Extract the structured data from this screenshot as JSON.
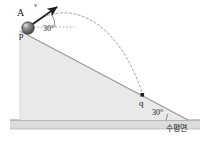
{
  "figure": {
    "type": "physics-projectile-on-incline-diagram",
    "colors": {
      "incline_fill": "#e9e9e9",
      "incline_stroke": "#9a9a9a",
      "ground_fill": "#dcdcdc",
      "ground_stroke": "#8f8f8f",
      "trajectory_stroke": "#9a9a9a",
      "arrow_stroke": "#1f1f1f",
      "ball_dark": "#4a4a4a",
      "ball_light": "#b8b8b8",
      "text": "#1a1a1a",
      "background": "#ffffff"
    },
    "labels": {
      "object_label": "A",
      "velocity_label": "v",
      "launch_point": "p",
      "landing_point": "q",
      "launch_angle": "30°",
      "incline_angle": "30°",
      "ground_label": "수평면"
    },
    "geometry": {
      "launch_point_xy": [
        28,
        28
      ],
      "landing_point_xy": [
        143,
        96
      ],
      "arrow_tip_xy": [
        59,
        5
      ],
      "incline_top_xy": [
        20,
        31
      ],
      "incline_base_xy": [
        188,
        120
      ],
      "ground_y": 120,
      "ground_height": 9,
      "ball_radius": 6
    }
  }
}
